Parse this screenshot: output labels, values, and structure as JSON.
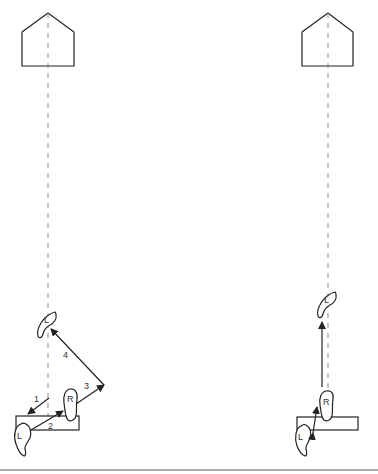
{
  "diagram": {
    "colors": {
      "stroke": "#222222",
      "dashed_line": "#888888",
      "bottom_rule": "#555555"
    },
    "left_panel": {
      "target_shape": "pentagon-house",
      "foot_labels": {
        "left_start": "L",
        "right": "R",
        "left_end": "L"
      },
      "step_labels": [
        "1",
        "2",
        "3",
        "4"
      ]
    },
    "right_panel": {
      "target_shape": "pentagon-house",
      "foot_labels": {
        "left_start": "L",
        "right": "R",
        "left_end": "L"
      }
    }
  }
}
